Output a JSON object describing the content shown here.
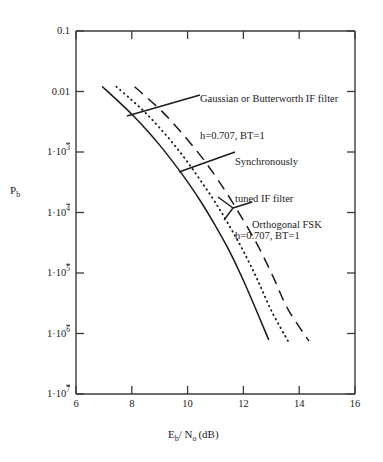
{
  "chart_data": {
    "type": "line",
    "title": "",
    "xlabel": "E_b / N_o (dB)",
    "ylabel": "P_b",
    "xlim": [
      6,
      16
    ],
    "ylim": [
      1e-07,
      0.1
    ],
    "yscale": "log",
    "xscale": "linear",
    "grid": false,
    "legend": "annotations-inline",
    "xticks": [
      6,
      8,
      10,
      12,
      14,
      16
    ],
    "xtick_labels": [
      "6",
      "8",
      "10",
      "12",
      "14",
      "16"
    ],
    "yticks": [
      0.1,
      0.01,
      0.001,
      0.0001,
      1e-05,
      1e-06,
      1e-07
    ],
    "ytick_labels": [
      "0.1",
      "0.01",
      "1·10⁻³",
      "1·10⁻⁴",
      "1·10⁻⁵",
      "1·10⁻⁶",
      "1·10⁻⁷"
    ],
    "series": [
      {
        "name": "Gaussian or Butterworth IF filter h=0.707, BT=1",
        "style": "solid",
        "points": [
          [
            6.95,
            0.012
          ],
          [
            7.5,
            0.007
          ],
          [
            8.0,
            0.0042
          ],
          [
            8.5,
            0.0024
          ],
          [
            9.0,
            0.0013
          ],
          [
            9.5,
            0.00066
          ],
          [
            10.0,
            0.00032
          ],
          [
            10.5,
            0.000145
          ],
          [
            11.0,
            6e-05
          ],
          [
            11.5,
            2.3e-05
          ],
          [
            12.0,
            7.5e-06
          ],
          [
            12.5,
            2.2e-06
          ],
          [
            12.9,
            8e-07
          ]
        ]
      },
      {
        "name": "Synchronously tuned IF filter h=0.707, BT=1",
        "style": "dotted",
        "points": [
          [
            7.45,
            0.012
          ],
          [
            8.0,
            0.0072
          ],
          [
            8.5,
            0.0044
          ],
          [
            9.0,
            0.0025
          ],
          [
            9.5,
            0.00135
          ],
          [
            10.0,
            0.00068
          ],
          [
            10.5,
            0.00032
          ],
          [
            11.0,
            0.000145
          ],
          [
            11.5,
            6e-05
          ],
          [
            12.0,
            2.3e-05
          ],
          [
            12.5,
            7.8e-06
          ],
          [
            13.0,
            2.4e-06
          ],
          [
            13.6,
            7.5e-07
          ]
        ]
      },
      {
        "name": "Orthogonal FSK",
        "style": "dashed",
        "points": [
          [
            8.1,
            0.012
          ],
          [
            8.6,
            0.0075
          ],
          [
            9.1,
            0.0046
          ],
          [
            9.6,
            0.0026
          ],
          [
            10.1,
            0.0014
          ],
          [
            10.6,
            0.00072
          ],
          [
            11.1,
            0.00034
          ],
          [
            11.6,
            0.00015
          ],
          [
            12.1,
            6.2e-05
          ],
          [
            12.6,
            2.4e-05
          ],
          [
            13.1,
            8e-06
          ],
          [
            13.6,
            2.5e-06
          ],
          [
            14.35,
            7.5e-07
          ]
        ]
      }
    ],
    "annotations": [
      {
        "id": "gaussian",
        "lines": [
          "Gaussian or Butterworth IF filter",
          "h=0.707, BT=1"
        ],
        "target_series": "Gaussian or Butterworth IF filter h=0.707, BT=1"
      },
      {
        "id": "synchronous",
        "lines": [
          "Synchronously",
          "tuned IF filter",
          "h=0.707, BT=1"
        ],
        "target_series": "Synchronously tuned IF filter h=0.707, BT=1"
      },
      {
        "id": "orthogonal",
        "lines": [
          "Orthogonal FSK"
        ],
        "target_series": "Orthogonal FSK"
      }
    ]
  },
  "axes": {
    "x_title_prefix": "E",
    "x_title_sub1": "b",
    "x_title_mid": "/ N",
    "x_title_sub2": "o",
    "x_title_suffix": "(dB)",
    "y_title_prefix": "P",
    "y_title_sub": "b"
  },
  "ytick_text": {
    "t0": "0.1",
    "t1": "0.01",
    "t2_mant": "1·10",
    "t2_exp": "3",
    "t3_mant": "1·10",
    "t3_exp": "4",
    "t4_mant": "1·10",
    "t4_exp": "5",
    "t5_mant": "1·10",
    "t5_exp": "6",
    "t6_mant": "1·10",
    "t6_exp": "7"
  },
  "xtick_text": {
    "t0": "6",
    "t1": "8",
    "t2": "10",
    "t3": "12",
    "t4": "14",
    "t5": "16"
  },
  "annotation_text": {
    "gaussian_l1": "Gaussian or Butterworth IF filter",
    "gaussian_l2": "h=0.707, BT=1",
    "sync_l1": "Synchronously",
    "sync_l2": "tuned IF filter",
    "sync_l3": "h=0.707, BT=1",
    "orthogonal_l1": "Orthogonal FSK"
  },
  "colors": {
    "ink": "#1a1a1a",
    "axis": "#444444",
    "background": "#ffffff"
  }
}
